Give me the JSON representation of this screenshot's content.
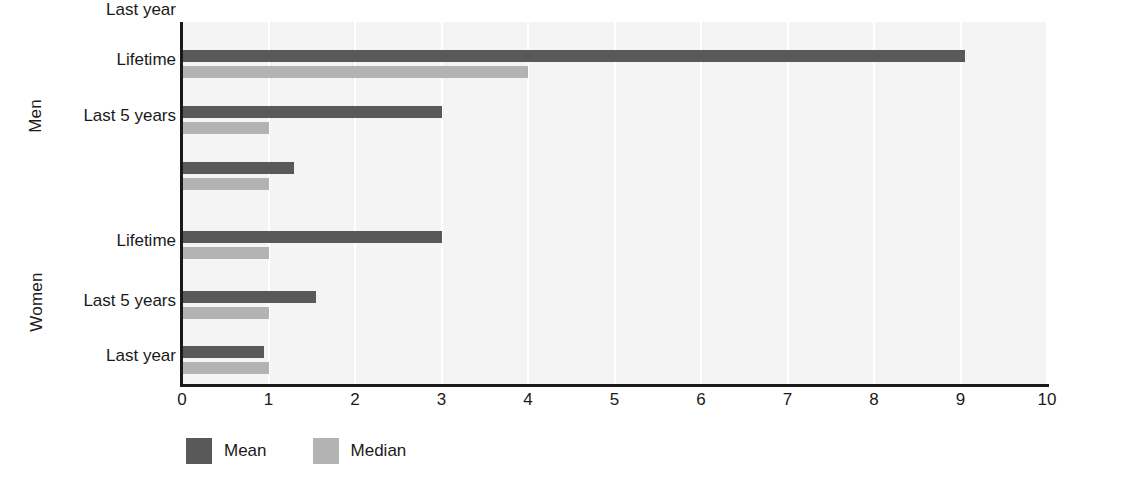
{
  "chart_data": {
    "type": "bar",
    "orientation": "horizontal",
    "title": "",
    "subtitle": "",
    "xlabel": "",
    "ylabel": "",
    "xlim": [
      0,
      10
    ],
    "xticks": [
      "0",
      "1",
      "2",
      "3",
      "4",
      "5",
      "6",
      "7",
      "8",
      "9",
      "10"
    ],
    "grid": "vertical-white-gridlines",
    "legend_position": "bottom-left",
    "groups": [
      {
        "name": "Men",
        "categories": [
          "Lifetime",
          "Last 5 years",
          "Last year"
        ],
        "mean": [
          9.05,
          3.0,
          1.3
        ],
        "median": [
          4.0,
          1.0,
          1.0
        ]
      },
      {
        "name": "Women",
        "categories": [
          "Lifetime",
          "Last 5 years",
          "Last year"
        ],
        "mean": [
          3.0,
          1.55,
          0.95
        ],
        "median": [
          1.0,
          1.0,
          1.0
        ]
      }
    ],
    "series": [
      {
        "name": "Mean",
        "color": "#595959",
        "values": [
          9.05,
          3.0,
          1.3,
          3.0,
          1.55,
          0.95
        ]
      },
      {
        "name": "Median",
        "color": "#b3b3b3",
        "values": [
          4.0,
          1.0,
          1.0,
          1.0,
          1.0,
          1.0
        ]
      }
    ],
    "categories": [
      "Men - Lifetime",
      "Men - Last 5 years",
      "Men - Last year",
      "Women - Lifetime",
      "Women - Last 5 years",
      "Women - Last year"
    ]
  },
  "axis": {
    "group_labels": [
      {
        "label": "Men"
      },
      {
        "label": "Women"
      }
    ],
    "category_labels": [
      {
        "label": "Lifetime"
      },
      {
        "label": "Last 5 years"
      },
      {
        "label": "Last year"
      },
      {
        "label": "Lifetime"
      },
      {
        "label": "Last 5 years"
      },
      {
        "label": "Last year"
      }
    ],
    "x_tick_labels": [
      {
        "label": "0"
      },
      {
        "label": "1"
      },
      {
        "label": "2"
      },
      {
        "label": "3"
      },
      {
        "label": "4"
      },
      {
        "label": "5"
      },
      {
        "label": "6"
      },
      {
        "label": "7"
      },
      {
        "label": "8"
      },
      {
        "label": "9"
      },
      {
        "label": "10"
      }
    ]
  },
  "legend": {
    "items": [
      {
        "label": "Mean",
        "color": "#595959"
      },
      {
        "label": "Median",
        "color": "#b3b3b3"
      }
    ]
  },
  "colors": {
    "mean": "#595959",
    "median": "#b3b3b3",
    "plot_background": "#f4f4f4",
    "gridline": "#ffffff",
    "axis": "#1a1a1a",
    "text": "#1a1a1a",
    "page_background": "#ffffff"
  }
}
